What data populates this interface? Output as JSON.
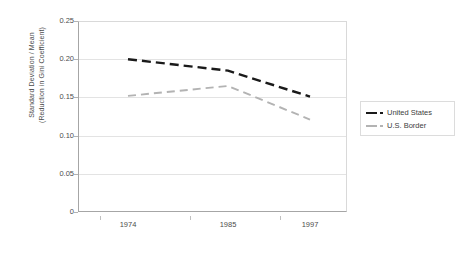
{
  "chart_data": {
    "type": "line",
    "title": "",
    "xlabel": "",
    "ylabel": "Standard Deviation / Mean (Reduction in Gini Coefficient)",
    "ylabel_line1": "Standard Deviation / Mean",
    "ylabel_line2": "(Reduction in Gini Coefficient)",
    "categories": [
      "1974",
      "1985",
      "1997"
    ],
    "ylim": [
      0,
      0.25
    ],
    "yticks": [
      "0",
      "0.05",
      "0.10",
      "0.15",
      "0.20",
      "0.25"
    ],
    "ytick_values": [
      0,
      0.05,
      0.1,
      0.15,
      0.2,
      0.25
    ],
    "grid": true,
    "legend_position": "right",
    "series": [
      {
        "name": "United States",
        "values": [
          0.2,
          0.185,
          0.151
        ],
        "color": "#1a1a1a",
        "style": "dashed"
      },
      {
        "name": "U.S. Border",
        "values": [
          0.152,
          0.165,
          0.121
        ],
        "color": "#b3b3b3",
        "style": "dashed"
      }
    ]
  },
  "legend": {
    "items": [
      {
        "label": "United States",
        "color": "#1a1a1a"
      },
      {
        "label": "U.S. Border",
        "color": "#b3b3b3"
      }
    ]
  }
}
